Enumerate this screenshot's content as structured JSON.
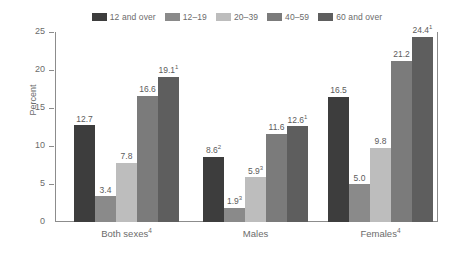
{
  "chart_data": {
    "type": "bar",
    "title": "",
    "xlabel": "",
    "ylabel": "Percent",
    "ylim": [
      0,
      25
    ],
    "yticks": [
      0,
      5,
      10,
      15,
      20,
      25
    ],
    "ytick_labels": [
      "0",
      "5",
      "10",
      "15",
      "20",
      "25"
    ],
    "grid": false,
    "legend_position": "top-center",
    "categories": [
      "Both sexes⁴",
      "Males",
      "Females⁴"
    ],
    "category_plain": [
      "Both sexes",
      "Males",
      "Females"
    ],
    "category_footnotes": [
      "4",
      "",
      "4"
    ],
    "series": [
      {
        "name": "12 and over",
        "color": "#3d3d3d",
        "values": [
          12.7,
          8.6,
          16.5
        ],
        "labels": [
          "12.7",
          "8.6",
          "16.5"
        ],
        "footnotes": [
          "",
          "2",
          ""
        ]
      },
      {
        "name": "12–19",
        "color": "#8a8a8a",
        "values": [
          3.4,
          1.9,
          5.0
        ],
        "labels": [
          "3.4",
          "1.9",
          "5.0"
        ],
        "footnotes": [
          "",
          "3",
          ""
        ]
      },
      {
        "name": "20–39",
        "color": "#bdbdbd",
        "values": [
          7.8,
          5.9,
          9.8
        ],
        "labels": [
          "7.8",
          "5.9",
          "9.8"
        ],
        "footnotes": [
          "",
          "3",
          ""
        ]
      },
      {
        "name": "40–59",
        "color": "#7b7b7b",
        "values": [
          16.6,
          11.6,
          21.2
        ],
        "labels": [
          "16.6",
          "11.6",
          "21.2"
        ],
        "footnotes": [
          "",
          "",
          ""
        ]
      },
      {
        "name": "60 and over",
        "color": "#5e5e5e",
        "values": [
          19.1,
          12.6,
          24.4
        ],
        "labels": [
          "19.1",
          "12.6",
          "24.4"
        ],
        "footnotes": [
          "1",
          "1",
          "1"
        ]
      }
    ]
  },
  "legend": {
    "items": [
      {
        "label": "12 and over",
        "color": "#3d3d3d"
      },
      {
        "label": "12–19",
        "color": "#8a8a8a"
      },
      {
        "label": "20–39",
        "color": "#bdbdbd"
      },
      {
        "label": "40–59",
        "color": "#7b7b7b"
      },
      {
        "label": "60 and over",
        "color": "#5e5e5e"
      }
    ]
  },
  "axis": {
    "y_title": "Percent"
  }
}
